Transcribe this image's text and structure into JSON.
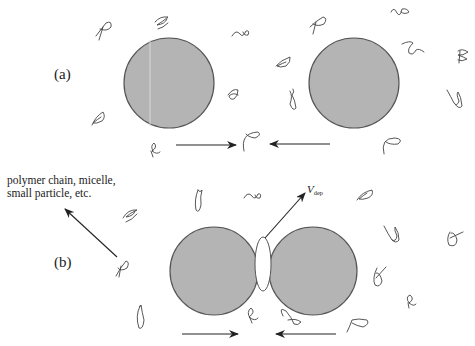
{
  "panels": {
    "a": {
      "label": "(a)"
    },
    "b": {
      "label": "(b)"
    }
  },
  "annotation": {
    "line1": "polymer chain, micelle,",
    "line2": "small particle, etc."
  },
  "velocity_label": {
    "symbol": "V",
    "subscript": "dep"
  },
  "colors": {
    "particle_fill": "#b4b4b4",
    "particle_stroke": "#555555",
    "arrow": "#222222",
    "chain": "#444444",
    "background": "#ffffff"
  },
  "particles": {
    "a": [
      {
        "cx": 169,
        "cy": 83,
        "r": 45
      },
      {
        "cx": 354,
        "cy": 83,
        "r": 45
      }
    ],
    "b": [
      {
        "cx": 214,
        "cy": 271,
        "r": 44
      },
      {
        "cx": 313,
        "cy": 271,
        "r": 44
      }
    ]
  },
  "depletion_zone": {
    "cx": 263,
    "cy": 264,
    "rx": 8,
    "ry": 27
  }
}
